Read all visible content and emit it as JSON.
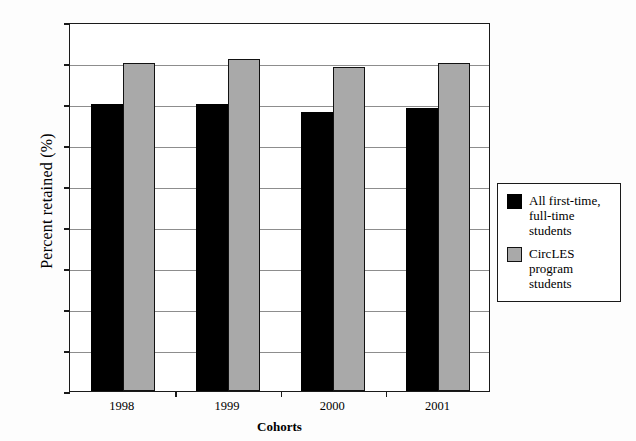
{
  "chart_data": {
    "type": "bar",
    "title": "",
    "xlabel": "Cohorts",
    "ylabel": "Percent retained (%)",
    "categories": [
      "1998",
      "1999",
      "2000",
      "2001"
    ],
    "series": [
      {
        "name": "All first-time, full-time students",
        "color": "#000000",
        "values": [
          70,
          70,
          68,
          69
        ]
      },
      {
        "name": "CircLES program students",
        "color": "#a9a9a9",
        "values": [
          80,
          81,
          79,
          80
        ]
      }
    ],
    "ylim": [
      0,
      90
    ],
    "ytick_labels": [
      "0",
      "10",
      "20",
      "30",
      "40",
      "50",
      "60",
      "70",
      "80",
      "90"
    ],
    "ytick_values": [
      0,
      10,
      20,
      30,
      40,
      50,
      60,
      70,
      80,
      90
    ],
    "grid": true,
    "legend_position": "right",
    "legend_entries": [
      {
        "line1": "All first-time,",
        "line2": "full-time students"
      },
      {
        "line1": "CircLES program",
        "line2": "students"
      }
    ]
  }
}
